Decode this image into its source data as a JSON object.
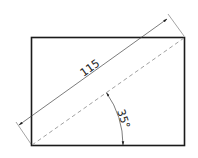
{
  "diagram": {
    "type": "technical-drawing",
    "rectangle": {
      "x": 31,
      "y": 37,
      "width": 153,
      "height": 108
    },
    "diagonal": {
      "style": "dashed",
      "from": [
        32,
        145
      ],
      "to": [
        184,
        38
      ]
    },
    "length_dimension": {
      "label": "115"
    },
    "angle_dimension": {
      "label": "35°"
    },
    "colors": {
      "outline": "#1a1a1a",
      "thin": "#555555",
      "dashed": "#888888"
    }
  }
}
